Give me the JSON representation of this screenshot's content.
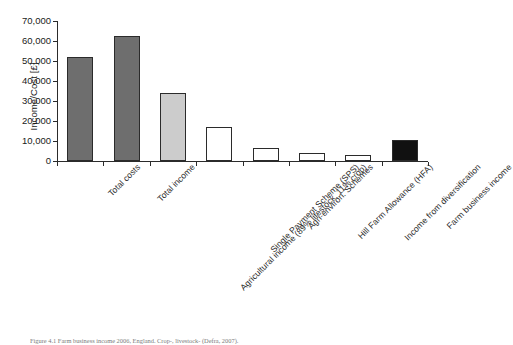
{
  "figure": {
    "caption": "Figure 4.1 Farm business income 2006, England. Crop-, livestock- (Defra, 2007)."
  },
  "chart_data": {
    "type": "bar",
    "title": "",
    "xlabel": "",
    "ylabel": "Income/Cost [£]",
    "ylim": [
      0,
      70000
    ],
    "ytick_interval": 10000,
    "ytick_labels": [
      "0",
      "10,000",
      "20,000",
      "30,000",
      "40,000",
      "50,000",
      "60,000",
      "70,000"
    ],
    "ytick_values": [
      0,
      10000,
      20000,
      30000,
      40000,
      50000,
      60000,
      70000
    ],
    "grid": false,
    "legend": "none",
    "categories": [
      "Total costs",
      "Total income",
      "Agricultural income (89% lifestock, 11% crop)",
      "Single Payment Scheme (SPS)",
      "Agri-environ. Schemes",
      "Hill Farm Allowance (HFA)",
      "Income from diversification",
      "Farm business income"
    ],
    "values": [
      51800,
      62400,
      34200,
      16800,
      6300,
      3800,
      3000,
      10600
    ],
    "bar_colors": [
      "#6e6e6e",
      "#6e6e6e",
      "#cccccc",
      "#ffffff",
      "#ffffff",
      "#ffffff",
      "#ffffff",
      "#111111"
    ],
    "currency": "£",
    "axis_color": "#2b2b2b"
  }
}
